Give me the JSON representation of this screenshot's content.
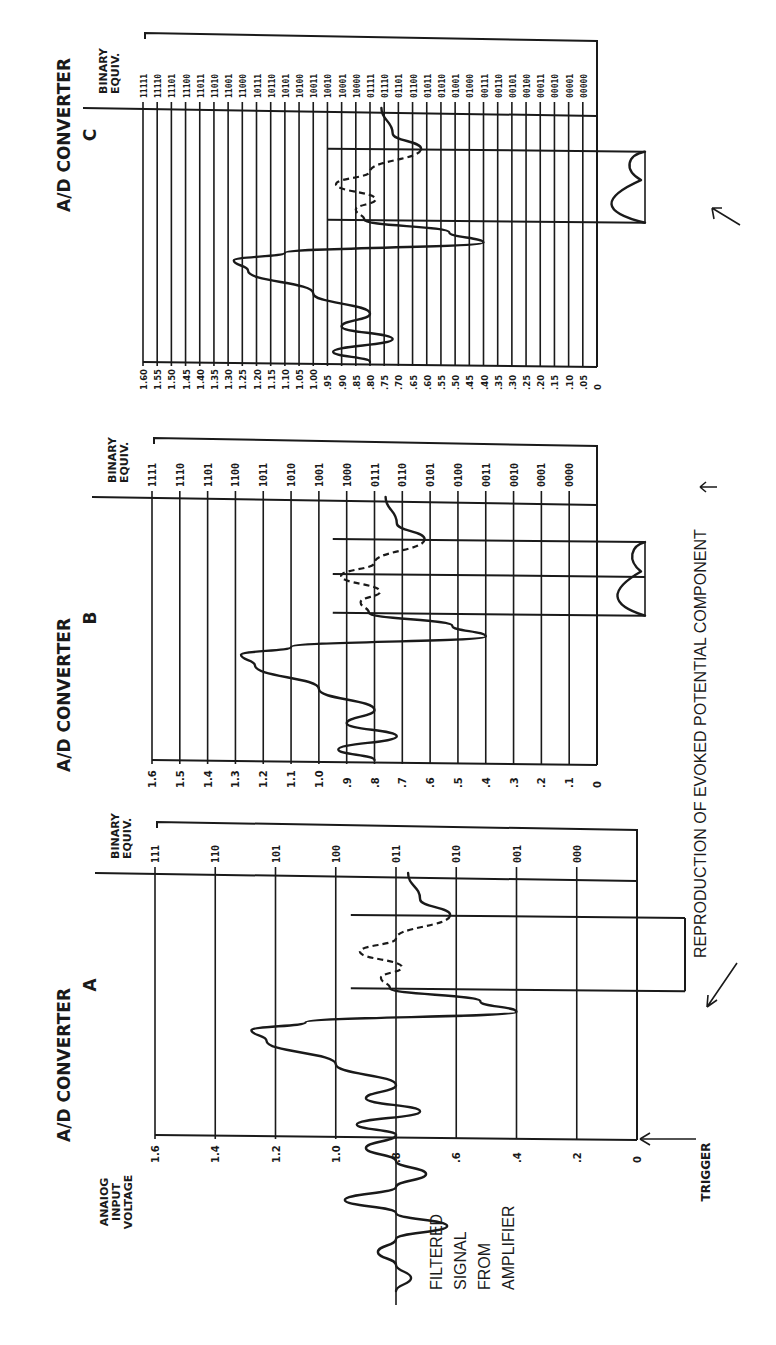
{
  "figure": {
    "orientation": "rotated-90-ccw",
    "ink_color": "#1a1a1a",
    "background": "#ffffff"
  },
  "labels": {
    "analog_axis_title": [
      "ANAIOG",
      "INPUT",
      "VOLTAGE"
    ],
    "binary_axis_title": [
      "BINARY",
      "EQUIV."
    ],
    "filtered_signal": [
      "FILTERED",
      "SIGNAL",
      "FROM",
      "AMPLIFIER"
    ],
    "trigger": "TRIGGER",
    "reproduction": "REPRODUCTION OF EVOKED POTENTIAL COMPONENT"
  },
  "panels": [
    {
      "id": "A",
      "title_line1": "A/D  CONVERTER",
      "title_line2": "A",
      "bits": 3,
      "voltage_ticks": [
        "1.6",
        "1.4",
        "1.2",
        "1.0",
        ".8",
        ".6",
        ".4",
        ".2",
        "0"
      ],
      "binary_codes": [
        "111",
        "110",
        "101",
        "100",
        "011",
        "010",
        "001",
        "000"
      ]
    },
    {
      "id": "B",
      "title_line1": "A/D  CONVERTER",
      "title_line2": "B",
      "bits": 4,
      "voltage_ticks": [
        "1.6",
        "1.5",
        "1.4",
        "1.3",
        "1.2",
        "1.1",
        "1.0",
        ".9",
        ".8",
        ".7",
        ".6",
        ".5",
        ".4",
        ".3",
        ".2",
        ".1",
        "0"
      ],
      "binary_codes": [
        "1111",
        "1110",
        "1101",
        "1100",
        "1011",
        "1010",
        "1001",
        "1000",
        "0111",
        "0110",
        "0101",
        "0100",
        "0011",
        "0010",
        "0001",
        "0000"
      ]
    },
    {
      "id": "C",
      "title_line1": "A/D  CONVERTER",
      "title_line2": "C",
      "bits": 5,
      "voltage_ticks": [
        "1.60",
        "1.55",
        "1.50",
        "1.45",
        "1.40",
        "1.35",
        "1.30",
        "1.25",
        "1.20",
        "1.15",
        "1.10",
        "1.05",
        "1.00",
        ".95",
        ".90",
        ".85",
        ".80",
        ".75",
        ".70",
        ".65",
        ".60",
        ".55",
        ".50",
        ".45",
        ".40",
        ".35",
        ".30",
        ".25",
        ".20",
        ".15",
        ".10",
        ".05",
        "0"
      ],
      "binary_codes": [
        "11111",
        "11110",
        "11101",
        "11100",
        "11011",
        "11010",
        "11001",
        "11000",
        "10111",
        "10110",
        "10101",
        "10100",
        "10011",
        "10010",
        "10001",
        "10000",
        "01111",
        "01110",
        "01101",
        "01100",
        "01011",
        "01010",
        "01001",
        "01000",
        "00111",
        "00110",
        "00101",
        "00100",
        "00011",
        "00010",
        "00001",
        "00000"
      ]
    }
  ],
  "waveform": {
    "description": "Filtered signal vs time after trigger; voltage in volts",
    "baseline_v": 0.8,
    "points_t_v": [
      [
        0.0,
        0.8
      ],
      [
        0.04,
        0.93
      ],
      [
        0.09,
        0.72
      ],
      [
        0.14,
        0.9
      ],
      [
        0.19,
        0.8
      ],
      [
        0.27,
        1.0
      ],
      [
        0.36,
        1.23
      ],
      [
        0.4,
        1.28
      ],
      [
        0.43,
        1.1
      ],
      [
        0.47,
        0.4
      ],
      [
        0.51,
        0.52
      ],
      [
        0.56,
        0.82
      ],
      [
        0.6,
        0.85
      ],
      [
        0.64,
        0.78
      ],
      [
        0.7,
        0.92
      ],
      [
        0.75,
        0.8
      ],
      [
        0.84,
        0.62
      ],
      [
        0.9,
        0.72
      ],
      [
        1.0,
        0.76
      ]
    ],
    "evoked_window_t": [
      0.56,
      0.84
    ],
    "pre_trigger_points": [
      [
        0,
        0.8
      ],
      [
        1,
        0.9
      ],
      [
        2,
        0.8
      ],
      [
        3,
        0.7
      ],
      [
        4,
        0.8
      ],
      [
        5,
        0.97
      ],
      [
        6,
        0.8
      ],
      [
        7,
        0.63
      ],
      [
        8,
        0.8
      ],
      [
        9,
        0.86
      ],
      [
        10,
        0.8
      ],
      [
        11,
        0.75
      ],
      [
        12,
        0.8
      ]
    ]
  }
}
